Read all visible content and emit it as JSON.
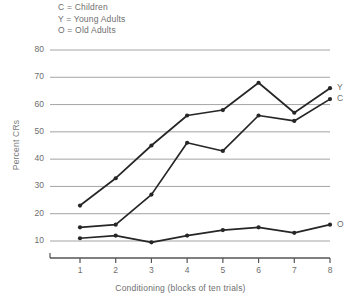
{
  "legend": {
    "entries": [
      {
        "key": "C",
        "text": "C = Children"
      },
      {
        "key": "Y",
        "text": "Y = Young Adults"
      },
      {
        "key": "O",
        "text": "O = Old Adults"
      }
    ]
  },
  "axis": {
    "y_title": "Percent CRs",
    "x_title": "Conditioning (blocks of ten trials)",
    "y_ticks": [
      "10",
      "20",
      "30",
      "40",
      "50",
      "60",
      "70",
      "80"
    ],
    "x_ticks": [
      "1",
      "2",
      "3",
      "4",
      "5",
      "6",
      "7",
      "8"
    ]
  },
  "series_labels": {
    "young": "Y",
    "children": "C",
    "old": "O"
  },
  "colors": {
    "line": "#262626",
    "grid": "#9a9a9a",
    "axis": "#555555",
    "text": "#6e6e6e"
  },
  "chart_data": {
    "type": "line",
    "title": "",
    "xlabel": "Conditioning (blocks of ten trials)",
    "ylabel": "Percent CRs",
    "categories": [
      1,
      2,
      3,
      4,
      5,
      6,
      7,
      8
    ],
    "xlim": [
      0.5,
      8.3
    ],
    "ylim": [
      5,
      82
    ],
    "yticks": [
      10,
      20,
      30,
      40,
      50,
      60,
      70,
      80
    ],
    "grid": "horizontal",
    "legend_position": "top-left (text key) and right-of-line end labels",
    "series": [
      {
        "name": "Young Adults",
        "key": "Y",
        "values": [
          23,
          33,
          45,
          56,
          58,
          68,
          57,
          66
        ]
      },
      {
        "name": "Children",
        "key": "C",
        "values": [
          15,
          16,
          27,
          46,
          43,
          56,
          54,
          62
        ]
      },
      {
        "name": "Old Adults",
        "key": "O",
        "values": [
          11,
          12,
          9.5,
          12,
          14,
          15,
          13,
          16
        ]
      }
    ]
  }
}
